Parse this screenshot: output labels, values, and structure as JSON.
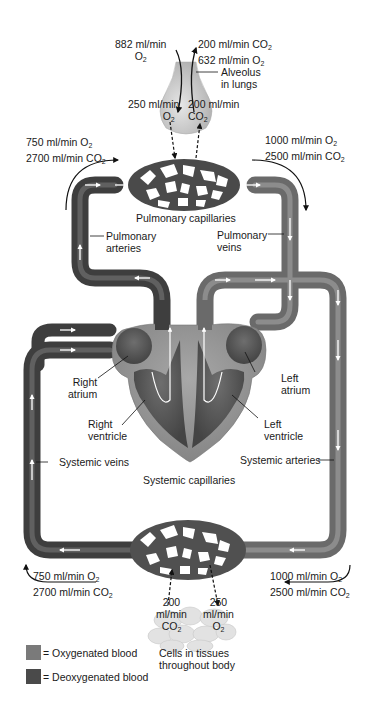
{
  "colors": {
    "oxygenated": "#7a7a7a",
    "deoxygenated": "#4a4a4a",
    "heart_wall": "#9a9a9a",
    "vessel_dark": "#505050",
    "vessel_light": "#767676",
    "capillary_stroke": "#3c3c3c",
    "alveolus": "#cfcfcf",
    "arrow_white": "#ffffff",
    "text": "#1a1a1a"
  },
  "alveolus": {
    "in_rate": "882 ml/min",
    "in_gas": "O",
    "in_gas_sub": "2",
    "out_co2": "200 ml/min CO",
    "out_co2_sub": "2",
    "out_o2": "632 ml/min O",
    "out_o2_sub": "2",
    "label_line1": "Alveolus",
    "label_line2": "in lungs",
    "down_rate": "250 ml/min",
    "down_gas": "O",
    "down_gas_sub": "2",
    "up_rate": "200 ml/min",
    "up_gas": "CO",
    "up_gas_sub": "2"
  },
  "pulmonary": {
    "in_o2": "750 ml/min O",
    "in_o2_sub": "2",
    "in_co2": "2700 ml/min CO",
    "in_co2_sub": "2",
    "out_o2": "1000 ml/min O",
    "out_o2_sub": "2",
    "out_co2": "2500 ml/min CO",
    "out_co2_sub": "2",
    "capillaries_label": "Pulmonary capillaries",
    "arteries_line1": "Pulmonary",
    "arteries_line2": "arteries",
    "veins_line1": "Pulmonary",
    "veins_line2": "veins"
  },
  "heart": {
    "right_atrium_line1": "Right",
    "right_atrium_line2": "atrium",
    "right_ventricle_line1": "Right",
    "right_ventricle_line2": "ventricle",
    "left_atrium_line1": "Left",
    "left_atrium_line2": "atrium",
    "left_ventricle_line1": "Left",
    "left_ventricle_line2": "ventricle"
  },
  "systemic": {
    "veins_label": "Systemic veins",
    "arteries_label": "Systemic arteries",
    "capillaries_label": "Systemic capillaries",
    "out_o2": "750 ml/min O",
    "out_o2_sub": "2",
    "out_co2": "2700 ml/min CO",
    "out_co2_sub": "2",
    "in_o2": "1000 ml/min O",
    "in_o2_sub": "2",
    "in_co2": "2500 ml/min CO",
    "in_co2_sub": "2"
  },
  "tissues": {
    "co2_rate": "200",
    "co2_unit": "ml/min",
    "co2_gas": "CO",
    "co2_gas_sub": "2",
    "o2_rate": "250",
    "o2_unit": "ml/min",
    "o2_gas": "O",
    "o2_gas_sub": "2",
    "label_line1": "Cells in tissues",
    "label_line2": "throughout body"
  },
  "legend": {
    "oxygenated_label": "= Oxygenated blood",
    "deoxygenated_label": "= Deoxygenated blood"
  }
}
